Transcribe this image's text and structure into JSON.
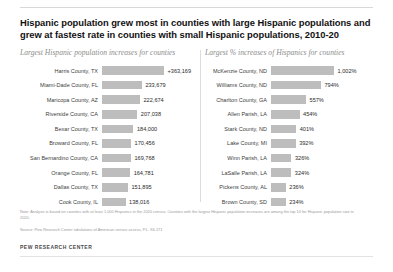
{
  "header": {
    "title": "Hispanic population grew most in counties with large Hispanic populations and grew at fastest rate in counties with small Hispanic populations, 2010-20"
  },
  "panes": {
    "left_title": "Largest Hispanic population increases for counties",
    "right_title": "Largest % increases of Hispanics for counties"
  },
  "footnotes": {
    "note": "Note: Analysis is based on counties with at least 1,000 Hispanics in the 2020 census. Counties with the largest Hispanic population increases are among the top 10 for Hispanic population size in 2020.",
    "source": "Source: Pew Research Center tabulations of American census access, P.L. 94-171",
    "brand": "PEW RESEARCH CENTER"
  },
  "colors": {
    "bar": "#bdbdbd",
    "divider": "#dcdcdc",
    "title": "#111111",
    "pane_title": "#8d8d8d"
  },
  "chart_data": [
    {
      "type": "bar",
      "title": "Largest Hispanic population increases for counties",
      "orientation": "horizontal",
      "xlabel": "",
      "ylabel": "",
      "grid": false,
      "legend": "none",
      "xlim": [
        0,
        363169
      ],
      "categories": [
        "Harris County, TX",
        "Miami-Dade County, FL",
        "Maricopa County, AZ",
        "Riverside County, CA",
        "Bexar County, TX",
        "Broward County, FL",
        "San Bernardino County, CA",
        "Orange County, FL",
        "Dallas County, TX",
        "Cook County, IL"
      ],
      "values": [
        363169,
        233679,
        222674,
        207038,
        184000,
        170456,
        169768,
        164781,
        151895,
        138016
      ],
      "labels": [
        "+363,169",
        "233,679",
        "222,674",
        "207,038",
        "184,000",
        "170,456",
        "169,768",
        "164,781",
        "151,895",
        "138,016"
      ]
    },
    {
      "type": "bar",
      "title": "Largest % increases of Hispanics for counties",
      "orientation": "horizontal",
      "xlabel": "",
      "ylabel": "",
      "grid": false,
      "legend": "none",
      "xlim": [
        0,
        1002
      ],
      "categories": [
        "McKenzie County, ND",
        "Williams County, ND",
        "Charlton County, GA",
        "Allen Parish, LA",
        "Stark County, ND",
        "Lake County, MI",
        "Winn Parish, LA",
        "LaSalle Parish, LA",
        "Pickens County, AL",
        "Brown County, SD"
      ],
      "values": [
        1002,
        794,
        557,
        454,
        401,
        392,
        326,
        324,
        236,
        234
      ],
      "labels": [
        "1,002%",
        "794%",
        "557%",
        "454%",
        "401%",
        "392%",
        "326%",
        "324%",
        "236%",
        "234%"
      ]
    }
  ]
}
